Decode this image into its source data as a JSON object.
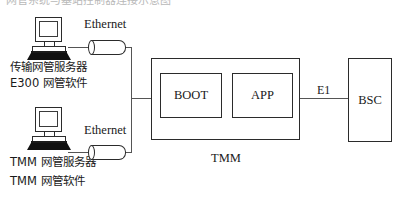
{
  "diagram": {
    "title_ghost": "网管系统与基站控制器连接示意图",
    "nodes": {
      "server_top": {
        "icon": "computer-icon",
        "label_line1": "传输网管服务器",
        "label_line2": "E300 网管软件"
      },
      "server_bottom": {
        "icon": "computer-icon",
        "label_line1": "TMM  网管服务器",
        "label_line2": "TMM  网管软件"
      },
      "transceiver_top": {
        "icon": "ethernet-transceiver-icon",
        "label": "Ethernet"
      },
      "transceiver_bottom": {
        "icon": "ethernet-transceiver-icon",
        "label": "Ethernet"
      },
      "tmm": {
        "caption": "TMM",
        "modules": [
          {
            "label": "BOOT"
          },
          {
            "label": "APP"
          }
        ]
      },
      "bsc": {
        "label": "BSC"
      }
    },
    "links": {
      "e1": {
        "label": "E1"
      }
    },
    "colors": {
      "stroke": "#2b2b2b",
      "wire": "#555555",
      "text": "#1a1a1a",
      "background": "#ffffff",
      "ghost_text": "#b9b9b9"
    }
  }
}
